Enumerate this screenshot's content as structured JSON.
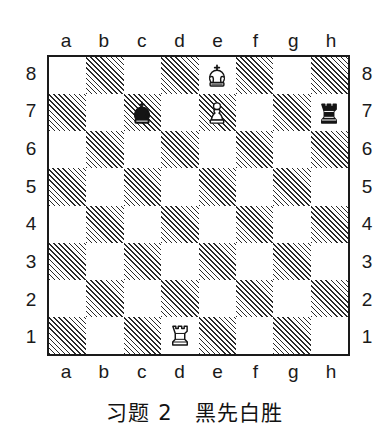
{
  "diagram": {
    "type": "chess-position-diagram",
    "caption": "习题 2　黑先白胜",
    "files": [
      "a",
      "b",
      "c",
      "d",
      "e",
      "f",
      "g",
      "h"
    ],
    "ranks": [
      "8",
      "7",
      "6",
      "5",
      "4",
      "3",
      "2",
      "1"
    ],
    "colors": {
      "light_square": "#ffffff",
      "dark_square_hatch": "#2a2a2a",
      "border": "#1a1a1a",
      "text": "#1a1a1a",
      "background": "#ffffff"
    },
    "board": {
      "orientation": "white-bottom",
      "dark_square_style": "diagonal-hatching",
      "squares_per_side": 8
    },
    "pieces": [
      {
        "square": "e8",
        "file": "e",
        "rank": "8",
        "color": "white",
        "type": "king",
        "glyph": "♔",
        "name": "white-king"
      },
      {
        "square": "c7",
        "file": "c",
        "rank": "7",
        "color": "black",
        "type": "king",
        "glyph": "♚",
        "name": "black-king"
      },
      {
        "square": "e7",
        "file": "e",
        "rank": "7",
        "color": "white",
        "type": "pawn",
        "glyph": "♙",
        "name": "white-pawn"
      },
      {
        "square": "h7",
        "file": "h",
        "rank": "7",
        "color": "black",
        "type": "rook",
        "glyph": "♜",
        "name": "black-rook"
      },
      {
        "square": "d1",
        "file": "d",
        "rank": "1",
        "color": "white",
        "type": "rook",
        "glyph": "♖",
        "name": "white-rook"
      }
    ]
  }
}
